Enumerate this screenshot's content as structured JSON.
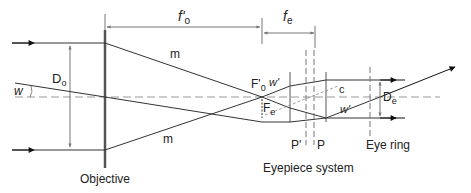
{
  "diagram": {
    "labels": {
      "f_o": "f'",
      "f_o_sub": "o",
      "f_e": "f",
      "f_e_sub": "e",
      "D_o": "D",
      "D_o_sub": "o",
      "w": "w",
      "m_top": "m",
      "m_bottom": "m",
      "F0": "F'",
      "F0_sub": "0",
      "w_prime": "w'",
      "Fe": "F",
      "Fe_sub": "e",
      "c": "c",
      "w_prime_2": "w'",
      "D_e": "D",
      "D_e_sub": "e",
      "P_prime": "P'",
      "P": "P",
      "eye_ring": "Eye ring",
      "objective": "Objective",
      "eyepiece_system": "Eyepiece system"
    },
    "colors": {
      "line": "#333333",
      "dashed": "#888888",
      "lens": "#555555"
    }
  }
}
